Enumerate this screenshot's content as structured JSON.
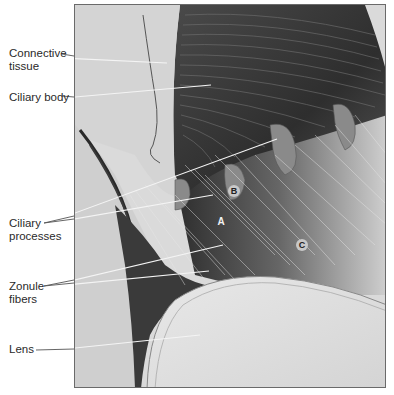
{
  "figure": {
    "labels": [
      {
        "id": "connective-tissue",
        "text": "Connective\ntissue",
        "line1": "Connective",
        "line2": "tissue"
      },
      {
        "id": "ciliary-body",
        "text": "Ciliary body"
      },
      {
        "id": "ciliary-processes",
        "line1": "Ciliary",
        "line2": "processes"
      },
      {
        "id": "zonule-fibers",
        "line1": "Zonule",
        "line2": "fibers"
      },
      {
        "id": "lens",
        "text": "Lens"
      }
    ],
    "letters": {
      "a": "A",
      "b": "B",
      "c": "C"
    },
    "colors": {
      "frame": "#6a6a6a",
      "tissue_light": "#d9d9d9",
      "ciliary_dark": "#3a3a3a",
      "lens": "#e4e4e4"
    }
  }
}
